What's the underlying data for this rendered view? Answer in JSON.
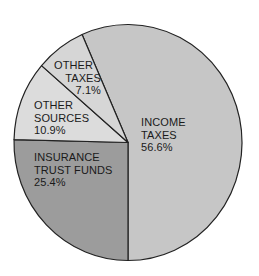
{
  "chart_data": {
    "type": "pie",
    "title": "",
    "categories": [
      "Income Taxes",
      "Insurance Trust Funds",
      "Other Sources",
      "Other Taxes"
    ],
    "values": [
      56.6,
      25.4,
      10.9,
      7.1
    ],
    "unit": "%",
    "slices": [
      {
        "label_lines": [
          "INCOME",
          "TAXES"
        ],
        "value_text": "56.6%",
        "value": 56.6,
        "color": "#c6c6c6"
      },
      {
        "label_lines": [
          "INSURANCE",
          "TRUST FUNDS"
        ],
        "value_text": "25.4%",
        "value": 25.4,
        "color": "#9c9c9c"
      },
      {
        "label_lines": [
          "OTHER",
          "SOURCES"
        ],
        "value_text": "10.9%",
        "value": 10.9,
        "color": "#dcdcdc"
      },
      {
        "label_lines": [
          "OTHER",
          "TAXES"
        ],
        "value_text": "7.1%",
        "value": 7.1,
        "color": "#d6d6d6"
      }
    ],
    "legend": "none (labels inside slices)",
    "outline_color": "#222222"
  }
}
